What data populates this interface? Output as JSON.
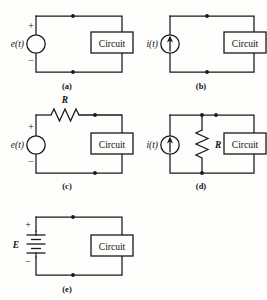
{
  "figure": {
    "background": "#fdfdfb",
    "ink": "#1a1a1a",
    "block_label": "Circuit"
  },
  "panels": [
    {
      "id": "a",
      "caption": "(a)",
      "source_label": "e(t)",
      "source_type": "voltage-source-circle",
      "plus": "+",
      "minus": "−",
      "block": "Circuit",
      "has_series_resistor": false,
      "has_parallel_resistor": false,
      "resistor_label": ""
    },
    {
      "id": "b",
      "caption": "(b)",
      "source_label": "i(t)",
      "source_type": "current-source-circle",
      "plus": "",
      "minus": "",
      "block": "Circuit",
      "has_series_resistor": false,
      "has_parallel_resistor": false,
      "resistor_label": ""
    },
    {
      "id": "c",
      "caption": "(c)",
      "source_label": "e(t)",
      "source_type": "voltage-source-circle",
      "plus": "+",
      "minus": "−",
      "block": "Circuit",
      "has_series_resistor": true,
      "has_parallel_resistor": false,
      "resistor_label": "R"
    },
    {
      "id": "d",
      "caption": "(d)",
      "source_label": "i(t)",
      "source_type": "current-source-circle",
      "plus": "",
      "minus": "",
      "block": "Circuit",
      "has_series_resistor": false,
      "has_parallel_resistor": true,
      "resistor_label": "R"
    },
    {
      "id": "e",
      "caption": "(e)",
      "source_label": "E",
      "source_type": "battery",
      "plus": "+",
      "minus": "−",
      "block": "Circuit",
      "has_series_resistor": false,
      "has_parallel_resistor": false,
      "resistor_label": ""
    }
  ]
}
